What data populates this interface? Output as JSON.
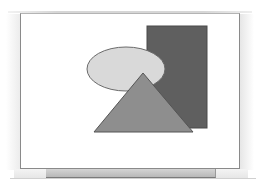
{
  "diagram": {
    "frame": {
      "x": 20,
      "y": 13,
      "width": 218,
      "height": 154,
      "background": "#ffffff",
      "border": "#8a8a8a"
    },
    "shapes": [
      {
        "type": "rectangle",
        "name": "dark-rectangle",
        "x": 147,
        "y": 26,
        "width": 60,
        "height": 102,
        "fill": "#5f5f5f",
        "stroke": "#4a4a4a"
      },
      {
        "type": "ellipse",
        "name": "light-ellipse",
        "cx": 126,
        "cy": 69,
        "rx": 39,
        "ry": 22,
        "fill": "#d9d9d9",
        "stroke": "#6a6a6a"
      },
      {
        "type": "triangle",
        "name": "medium-triangle",
        "points": "143,73 94,132 193,132",
        "fill": "#8e8e8e",
        "stroke": "#555555"
      }
    ],
    "bottom_bar": {
      "x": 46,
      "y": 169,
      "width": 169,
      "height": 8,
      "fill": "#c4c4c4"
    }
  }
}
